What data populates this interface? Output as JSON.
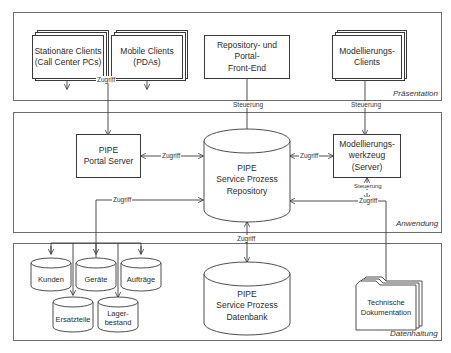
{
  "layers": {
    "praesentation": "Präsentation",
    "anwendung": "Anwendung",
    "datenhaltung": "Datenhaltung"
  },
  "praesentation": {
    "stationaere_clients": "Stationäre Clients\n(Call Center PCs)",
    "mobile_clients": "Mobile Clients\n(PDAs)",
    "frontend": "Repository- und Portal-\nFront-End",
    "modellierungs_clients": "Modellierungs-\nClients"
  },
  "anwendung": {
    "portal_server": "PIPE\nPortal Server",
    "repository": "PIPE\nService Prozess\nRepository",
    "modellierungswerkzeug": "Modellierungs-\nwerkzeug\n(Server)"
  },
  "datenhaltung": {
    "kunden": "Kunden",
    "geraete": "Geräte",
    "auftraege": "Aufträge",
    "ersatzteile": "Ersatzteile",
    "lagerbestand": "Lager-\nbestand",
    "datenbank": "PIPE\nService Prozess\nDatenbank",
    "technische_doku": "Technische\nDokumentation"
  },
  "connectors": {
    "zugriff_clients": "Zugriff",
    "steuerung_frontend": "Steuerung",
    "steuerung_modellierung": "Steuerung",
    "zugriff_portal_repo": "Zugriff",
    "zugriff_repo_werkzeug": "Zugriff",
    "steuerung_werkzeug": "Steuerung",
    "zugriff_doku": "Zugriff",
    "zugriff_daten": "Zugriff",
    "zugriff_datenbank": "Zugriff"
  },
  "colors": {
    "line": "#3a3a3a",
    "layer_border": "#6d6d6d",
    "background": "#ffffff"
  }
}
